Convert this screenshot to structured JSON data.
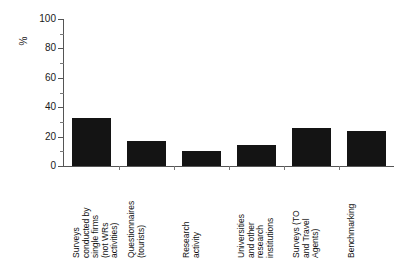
{
  "chart_data": {
    "type": "bar",
    "title": "",
    "xlabel": "",
    "ylabel": "%",
    "ylim": [
      0,
      100
    ],
    "ytick_step": 20,
    "yminor_step": 10,
    "grid": false,
    "legend": "none",
    "orientation": "vertical",
    "bar_color": "#141414",
    "categories": [
      "Surveys conducted by single firms (not WRs activities)",
      "Questionnaires (tourists)",
      "Research activity",
      "Universities and other research institutions",
      "Surveys (TO and Travel Agents)",
      "Benchmarking"
    ],
    "category_lines": [
      [
        "Surveys",
        "conducted by",
        "single firms",
        "(not WRs",
        "activities)"
      ],
      [
        "Questionnaires",
        "(tourists)"
      ],
      [
        "Research",
        "activity"
      ],
      [
        "Universities",
        "and other",
        "research",
        "institutions"
      ],
      [
        "Surveys (TO",
        "and Travel",
        "Agents)"
      ],
      [
        "Benchmarking"
      ]
    ],
    "values": [
      33,
      17,
      10,
      14,
      26,
      24
    ],
    "ytick_labels": [
      "0",
      "20",
      "40",
      "60",
      "80",
      "100"
    ],
    "ytick_values": [
      0,
      20,
      40,
      60,
      80,
      100
    ],
    "yminor_values": [
      10,
      30,
      50,
      70,
      90
    ]
  }
}
